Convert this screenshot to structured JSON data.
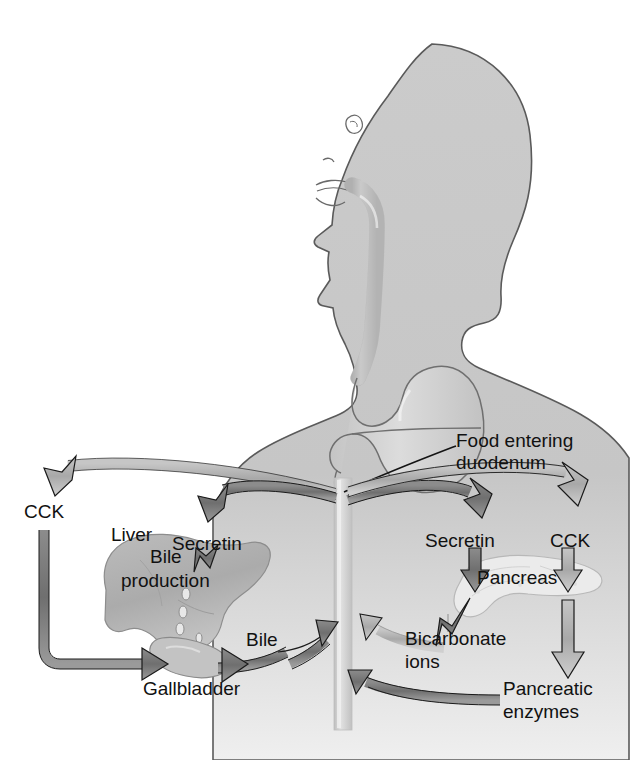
{
  "diagram": {
    "background_color": "#ffffff",
    "ink_color": "#111111",
    "palette": {
      "body_fill": "#c9c9c9",
      "body_outline": "#5a5a5a",
      "stomach_fill": "#d2d2d2",
      "duodenum_fill": "#d7d7d7",
      "liver_fill": "#b5b5b5",
      "gallbladder_fill": "#bdbdbd",
      "pancreas_fill": "#e6e6e6",
      "arrow_dark": "#787878",
      "arrow_light": "#b0b0b0",
      "arrow_outline": "#1a1a1a"
    }
  },
  "labels": {
    "food_entering_duodenum_line1": "Food entering",
    "food_entering_duodenum_line2": "duodenum",
    "cck_left": "CCK",
    "cck_right": "CCK",
    "secretin_left": "Secretin",
    "secretin_right": "Secretin",
    "liver": "Liver",
    "bile_production_line1": "Bile",
    "bile_production_line2": "production",
    "gallbladder": "Gallbladder",
    "bile": "Bile",
    "pancreas": "Pancreas",
    "bicarbonate_line1": "Bicarbonate",
    "bicarbonate_line2": "ions",
    "pancreatic_enzymes_line1": "Pancreatic",
    "pancreatic_enzymes_line2": "enzymes"
  },
  "anatomy": [
    {
      "name": "head-and-torso-profile",
      "description": "gray silhouette of head in left-facing profile with neck and shoulders"
    },
    {
      "name": "esophagus",
      "description": "tube descending from mouth through neck to stomach"
    },
    {
      "name": "stomach",
      "description": "J-shaped stomach with horizontal chyme level line"
    },
    {
      "name": "duodenum",
      "description": "vertical small-intestine tube below stomach"
    },
    {
      "name": "liver",
      "description": "large lobed organ on left producing bile droplets"
    },
    {
      "name": "gallbladder",
      "description": "small sac beneath the liver"
    },
    {
      "name": "pancreas",
      "description": "pale elongated gland on the right"
    }
  ],
  "flows": [
    {
      "name": "cck-to-gallbladder",
      "from": "duodenum",
      "to": "gallbladder",
      "hormone": "CCK",
      "tone": "light"
    },
    {
      "name": "secretin-to-liver",
      "from": "duodenum",
      "to": "liver",
      "hormone": "Secretin",
      "tone": "dark"
    },
    {
      "name": "secretin-to-pancreas",
      "from": "duodenum",
      "to": "pancreas",
      "hormone": "Secretin",
      "tone": "dark"
    },
    {
      "name": "cck-to-pancreas",
      "from": "duodenum",
      "to": "pancreas",
      "hormone": "CCK",
      "tone": "light"
    },
    {
      "name": "bile-to-duodenum",
      "from": "gallbladder",
      "to": "duodenum",
      "substance": "Bile",
      "tone": "dark"
    },
    {
      "name": "bicarbonate-to-duodenum",
      "from": "pancreas",
      "to": "duodenum",
      "substance": "Bicarbonate ions",
      "tone": "light"
    },
    {
      "name": "enzymes-to-duodenum",
      "from": "pancreas",
      "to": "duodenum",
      "substance": "Pancreatic enzymes",
      "tone": "dark"
    }
  ]
}
